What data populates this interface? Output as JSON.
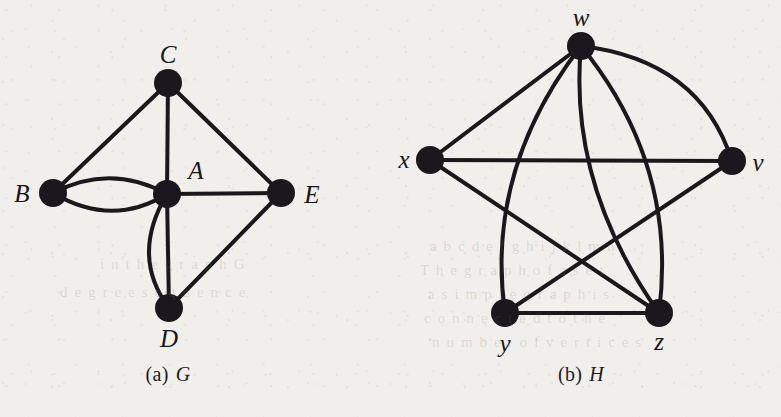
{
  "figure": {
    "panels": [
      {
        "id": "g",
        "caption_index": "(a)",
        "caption_letter": "G",
        "graph_name": "G",
        "vertices": [
          {
            "id": "A",
            "label": "A",
            "cx": 167,
            "cy": 194,
            "label_x": 196,
            "label_y": 170
          },
          {
            "id": "B",
            "label": "B",
            "cx": 53,
            "cy": 193,
            "label_x": 22,
            "label_y": 193
          },
          {
            "id": "C",
            "label": "C",
            "cx": 168,
            "cy": 83,
            "label_x": 168,
            "label_y": 54
          },
          {
            "id": "D",
            "label": "D",
            "cx": 169,
            "cy": 308,
            "label_x": 169,
            "label_y": 338
          },
          {
            "id": "E",
            "label": "E",
            "cx": 281,
            "cy": 193,
            "label_x": 312,
            "label_y": 194
          }
        ],
        "edges": [
          {
            "from": "C",
            "to": "B",
            "kind": "straight"
          },
          {
            "from": "C",
            "to": "A",
            "kind": "straight"
          },
          {
            "from": "C",
            "to": "E",
            "kind": "straight"
          },
          {
            "from": "B",
            "to": "A",
            "kind": "curve-up"
          },
          {
            "from": "B",
            "to": "A",
            "kind": "curve-down"
          },
          {
            "from": "A",
            "to": "E",
            "kind": "straight"
          },
          {
            "from": "A",
            "to": "D",
            "kind": "straight"
          },
          {
            "from": "A",
            "to": "D",
            "kind": "curve-left"
          },
          {
            "from": "D",
            "to": "E",
            "kind": "straight"
          }
        ]
      },
      {
        "id": "h",
        "caption_index": "(b)",
        "caption_letter": "H",
        "graph_name": "H",
        "vertices": [
          {
            "id": "w",
            "label": "w",
            "cx": 191,
            "cy": 46,
            "label_x": 191,
            "label_y": 17
          },
          {
            "id": "x",
            "label": "x",
            "cx": 40,
            "cy": 160,
            "label_x": 14,
            "label_y": 159
          },
          {
            "id": "v",
            "label": "v",
            "cx": 342,
            "cy": 161,
            "label_x": 368,
            "label_y": 162
          },
          {
            "id": "y",
            "label": "y",
            "cx": 115,
            "cy": 313,
            "label_x": 115,
            "label_y": 343
          },
          {
            "id": "z",
            "label": "z",
            "cx": 269,
            "cy": 313,
            "label_x": 269,
            "label_y": 341
          }
        ],
        "edges": [
          {
            "from": "w",
            "to": "x",
            "kind": "straight"
          },
          {
            "from": "w",
            "to": "v",
            "kind": "curve-right"
          },
          {
            "from": "w",
            "to": "y",
            "kind": "curve-left"
          },
          {
            "from": "w",
            "to": "z",
            "kind": "curve-slight"
          },
          {
            "from": "w",
            "to": "z",
            "kind": "curve-wide"
          },
          {
            "from": "x",
            "to": "v",
            "kind": "straight"
          },
          {
            "from": "x",
            "to": "z",
            "kind": "straight"
          },
          {
            "from": "y",
            "to": "v",
            "kind": "straight"
          },
          {
            "from": "y",
            "to": "z",
            "kind": "straight"
          }
        ]
      }
    ]
  },
  "style": {
    "ink_color": "#1a181c",
    "paper_color": "#f1efeb",
    "vertex_radius": 13,
    "edge_width": 4
  },
  "bleed_through_text": [
    {
      "text": "a b   c d e f g h i j   k l m n",
      "x": 430,
      "y": 238
    },
    {
      "text": "T h e   g r a p h   o f   a   s e t",
      "x": 420,
      "y": 262
    },
    {
      "text": "a   s i m p l e   g r a p h   i s",
      "x": 428,
      "y": 286
    },
    {
      "text": "c o n n e c t e d   t o   t h e",
      "x": 424,
      "y": 310
    },
    {
      "text": "n u m b e r   o f   v e r t i c e s",
      "x": 432,
      "y": 334
    },
    {
      "text": "i n   t h e   g r a p h   G",
      "x": 100,
      "y": 256
    },
    {
      "text": "d e g r e e   s e q u e n c e",
      "x": 60,
      "y": 284
    }
  ]
}
